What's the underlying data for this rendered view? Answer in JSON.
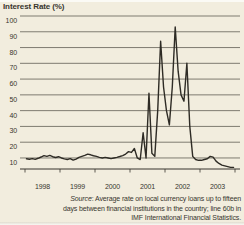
{
  "chart_data": {
    "type": "line",
    "title": "Interest Rate (%)",
    "xlabel": "",
    "ylabel": "Interest Rate (%)",
    "x_tick_labels": [
      "1998",
      "1999",
      "2000",
      "2001",
      "2002",
      "2003"
    ],
    "yticks": [
      100,
      90,
      80,
      70,
      60,
      50,
      40,
      30,
      20,
      10
    ],
    "ylim": [
      3,
      100
    ],
    "grid": "horizontal",
    "legend": "none",
    "line_color": "#2e2b25",
    "series": [
      {
        "name": "Interest Rate (%)",
        "start": "1998-01",
        "frequency": "monthly",
        "values": [
          9.5,
          9.2,
          9.6,
          9.1,
          9.8,
          10.6,
          11.5,
          11,
          11.6,
          10.8,
          10.3,
          10.8,
          10,
          9.4,
          9,
          9.6,
          8.6,
          9.3,
          10.4,
          11,
          11.6,
          12.4,
          12,
          11.4,
          11,
          10.4,
          10,
          10.4,
          10,
          9.6,
          10,
          10.4,
          10.9,
          11.5,
          12.5,
          14,
          13.5,
          16,
          10,
          9,
          26,
          10,
          51,
          13,
          11,
          40,
          84,
          55,
          40,
          31,
          55,
          93,
          65,
          50,
          46,
          70,
          30,
          11,
          9,
          8.5,
          8.5,
          9,
          9.5,
          11,
          10.5,
          8,
          6.5,
          5.5,
          5,
          4.5,
          4,
          4
        ]
      }
    ]
  },
  "source": {
    "label": "Source",
    "line1_rest": ": Average rate on local currency loans up to fifteen",
    "line2": "days between financial institutions in the country; line 60b in",
    "line3": "IMF International Financial Statistics."
  },
  "colors": {
    "background": "#f2edde",
    "gridline": "#4e4b42",
    "axis": "#38352e",
    "line": "#2e2b25",
    "text": "#38352e"
  }
}
